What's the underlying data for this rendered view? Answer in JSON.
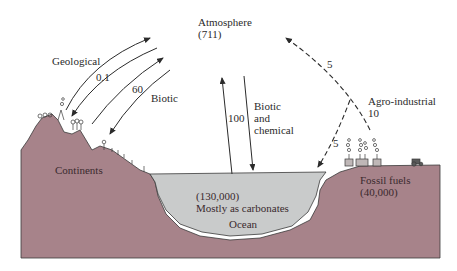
{
  "diagram": {
    "colors": {
      "land": "#a7838a",
      "ocean": "#c9cbcb",
      "ink": "#2b2b2b",
      "background": "#ffffff"
    },
    "reservoirs": {
      "atmosphere": {
        "label": "Atmosphere",
        "value": "(711)"
      },
      "continents": {
        "label": "Continents"
      },
      "ocean": {
        "value": "(130,000)",
        "note": "Mostly as carbonates",
        "label": "Ocean"
      },
      "fossil_fuels": {
        "label": "Fossil fuels",
        "value": "(40,000)"
      }
    },
    "fluxes": {
      "geological": {
        "label": "Geological",
        "value": "0.1",
        "direction": "both",
        "style": "solid"
      },
      "biotic_land": {
        "label": "Biotic",
        "value": "60",
        "direction": "both",
        "style": "solid"
      },
      "biotic_chemical": {
        "label_lines": [
          "Biotic",
          "and",
          "chemical"
        ],
        "value": "100",
        "direction": "both",
        "style": "solid"
      },
      "agro_industrial": {
        "label": "Agro-industrial",
        "value": "10",
        "style": "dashed"
      },
      "to_atmosphere": {
        "value": "5",
        "style": "dashed"
      },
      "to_ocean": {
        "value": "5",
        "style": "dashed"
      }
    }
  }
}
